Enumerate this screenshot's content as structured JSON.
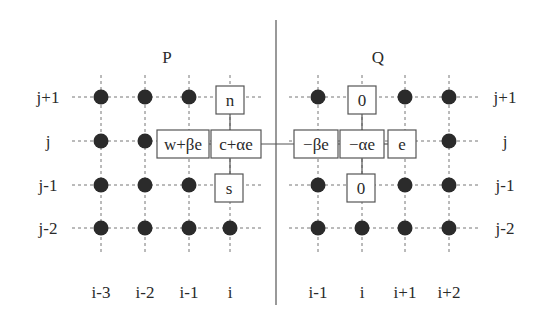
{
  "panels": [
    {
      "id": "P",
      "title": "P",
      "title_x": 167,
      "title_y": 63,
      "col_labels": [
        {
          "text": "i-3",
          "x": 101
        },
        {
          "text": "i-2",
          "x": 145
        },
        {
          "text": "i-1",
          "x": 189
        },
        {
          "text": "i",
          "x": 230
        }
      ],
      "row_labels": [
        {
          "text": "j+1",
          "y": 97,
          "x": 48
        },
        {
          "text": "j",
          "y": 141,
          "x": 48
        },
        {
          "text": "j-1",
          "y": 185,
          "x": 48
        },
        {
          "text": "j-2",
          "y": 228,
          "x": 48
        }
      ]
    },
    {
      "id": "Q",
      "title": "Q",
      "title_x": 378,
      "title_y": 63,
      "col_labels": [
        {
          "text": "i-1",
          "x": 318
        },
        {
          "text": "i",
          "x": 362
        },
        {
          "text": "i+1",
          "x": 405
        },
        {
          "text": "i+2",
          "x": 449
        }
      ],
      "row_labels": [
        {
          "text": "j+1",
          "y": 97,
          "x": 505
        },
        {
          "text": "j",
          "y": 141,
          "x": 505
        },
        {
          "text": "j-1",
          "y": 185,
          "x": 505
        },
        {
          "text": "j-2",
          "y": 228,
          "x": 505
        }
      ]
    }
  ],
  "divider": {
    "x": 276,
    "y1": 20,
    "y2": 305
  },
  "grid": {
    "P": {
      "xs": [
        101,
        145,
        189,
        230
      ],
      "ys": [
        97,
        141,
        185,
        228
      ],
      "hx": [
        72,
        262
      ],
      "vy": [
        75,
        255
      ]
    },
    "Q": {
      "xs": [
        318,
        362,
        405,
        449
      ],
      "ys": [
        97,
        141,
        185,
        228
      ],
      "hx": [
        289,
        478
      ],
      "vy": [
        75,
        255
      ]
    }
  },
  "dots": [
    [
      101,
      97
    ],
    [
      145,
      97
    ],
    [
      189,
      97
    ],
    [
      101,
      141
    ],
    [
      145,
      141
    ],
    [
      101,
      185
    ],
    [
      145,
      185
    ],
    [
      189,
      185
    ],
    [
      101,
      228
    ],
    [
      145,
      228
    ],
    [
      189,
      228
    ],
    [
      230,
      228
    ],
    [
      318,
      97
    ],
    [
      405,
      97
    ],
    [
      449,
      97
    ],
    [
      449,
      141
    ],
    [
      318,
      185
    ],
    [
      405,
      185
    ],
    [
      449,
      185
    ],
    [
      318,
      228
    ],
    [
      362,
      228
    ],
    [
      405,
      228
    ],
    [
      449,
      228
    ]
  ],
  "boxes": [
    {
      "id": "P-n",
      "text": "n",
      "cx": 230,
      "cy": 100,
      "w": 28,
      "h": 28
    },
    {
      "id": "P-w",
      "text": "w+βe",
      "cx": 183,
      "cy": 144,
      "w": 52,
      "h": 28
    },
    {
      "id": "P-c",
      "text": "c+αe",
      "cx": 236,
      "cy": 144,
      "w": 50,
      "h": 28
    },
    {
      "id": "P-s",
      "text": "s",
      "cx": 229,
      "cy": 188,
      "w": 28,
      "h": 28
    },
    {
      "id": "Q-n",
      "text": "0",
      "cx": 362,
      "cy": 100,
      "w": 28,
      "h": 28
    },
    {
      "id": "Q-w",
      "text": "−βe",
      "cx": 316,
      "cy": 144,
      "w": 44,
      "h": 28
    },
    {
      "id": "Q-c",
      "text": "−αe",
      "cx": 362,
      "cy": 144,
      "w": 44,
      "h": 28
    },
    {
      "id": "Q-e",
      "text": "e",
      "cx": 402,
      "cy": 144,
      "w": 28,
      "h": 28
    },
    {
      "id": "Q-s",
      "text": "0",
      "cx": 361,
      "cy": 188,
      "w": 28,
      "h": 28
    }
  ],
  "col_label_y": 298,
  "colors": {
    "line": "#555555",
    "dot": "#2b2b2b",
    "box_border": "#555555",
    "dashed": "#777777"
  }
}
